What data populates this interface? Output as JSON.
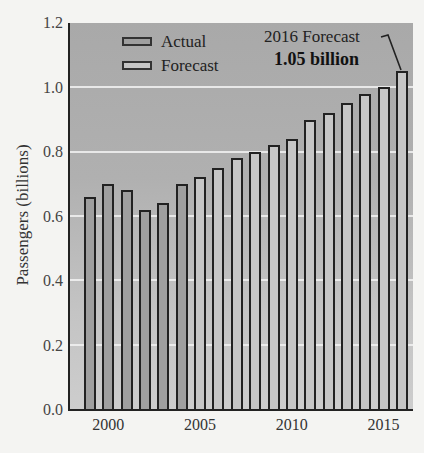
{
  "chart_data": {
    "type": "bar",
    "title": "",
    "xlabel": "",
    "ylabel": "Passengers (billions)",
    "ylim": [
      0.0,
      1.2
    ],
    "yticks": [
      "0.0",
      "0.2",
      "0.4",
      "0.6",
      "0.8",
      "1.0",
      "1.2"
    ],
    "xtick_labels": [
      "2000",
      "2005",
      "2010",
      "2015"
    ],
    "grid": true,
    "legend_position": "upper left",
    "categories": [
      "1999",
      "2000",
      "2001",
      "2002",
      "2003",
      "2004",
      "2005",
      "2006",
      "2007",
      "2008",
      "2009",
      "2010",
      "2011",
      "2012",
      "2013",
      "2014",
      "2015",
      "2016"
    ],
    "series": [
      {
        "name": "Actual",
        "color": "#9f9f9f",
        "values": [
          0.66,
          0.7,
          0.68,
          0.62,
          0.64,
          0.7,
          null,
          null,
          null,
          null,
          null,
          null,
          null,
          null,
          null,
          null,
          null,
          null
        ]
      },
      {
        "name": "Forecast",
        "color": "#c6c6c6",
        "values": [
          null,
          null,
          null,
          null,
          null,
          null,
          0.72,
          0.75,
          0.78,
          0.8,
          0.82,
          0.84,
          0.9,
          0.92,
          0.95,
          0.98,
          1.0,
          1.05
        ]
      }
    ],
    "annotations": [
      {
        "text": "2016 Forecast",
        "target": "2016"
      },
      {
        "text": "1.05 billion",
        "target": "2016",
        "bold": true
      }
    ]
  },
  "legend": {
    "actual": "Actual",
    "forecast": "Forecast"
  },
  "annotation": {
    "line1": "2016 Forecast",
    "line2": "1.05 billion"
  }
}
